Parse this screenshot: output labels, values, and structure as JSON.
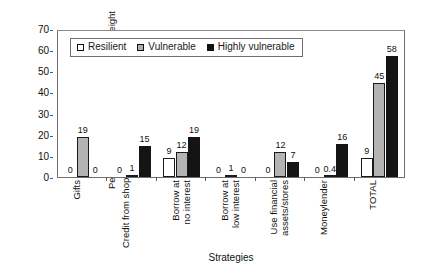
{
  "chart_data": {
    "type": "bar",
    "title": "",
    "xlabel": "Strategies",
    "ylabel_line1": "Percentage of total illness costs over eight",
    "ylabel_line2": "months covered by strategies",
    "ylim": [
      0,
      70
    ],
    "yticks": [
      0,
      10,
      20,
      30,
      40,
      50,
      60,
      70
    ],
    "grid": false,
    "legend_position": "top-left inside plot",
    "categories": [
      "Gifts",
      "Credit from shop",
      "Borrow at no interest",
      "Borrow at low interest",
      "Use financial assets/stores",
      "Moneylender",
      "TOTAL"
    ],
    "category_lines": [
      [
        "Gifts",
        ""
      ],
      [
        "Credit from shop",
        ""
      ],
      [
        "Borrow at",
        "no interest"
      ],
      [
        "Borrow at",
        "low interest"
      ],
      [
        "Use financial",
        "assets/stores"
      ],
      [
        "Moneylender",
        ""
      ],
      [
        "TOTAL",
        ""
      ]
    ],
    "series": [
      {
        "name": "Resilient",
        "color": "#ffffff",
        "values": [
          0,
          0,
          9,
          0,
          0,
          0,
          9
        ],
        "labels": [
          "0",
          "0",
          "9",
          "0",
          "0",
          "0",
          "9"
        ]
      },
      {
        "name": "Vulnerable",
        "color": "#b3b3b3",
        "values": [
          19,
          1,
          12,
          1,
          12,
          0.4,
          45
        ],
        "labels": [
          "19",
          "1",
          "12",
          "1",
          "12",
          "0.4",
          "45"
        ]
      },
      {
        "name": "Highly vulnerable",
        "color": "#141414",
        "values": [
          0,
          15,
          19,
          0,
          7,
          16,
          58
        ],
        "labels": [
          "0",
          "15",
          "19",
          "0",
          "7",
          "16",
          "58"
        ]
      }
    ]
  },
  "legend": {
    "items": [
      {
        "label": "Resilient"
      },
      {
        "label": "Vulnerable"
      },
      {
        "label": "Highly vulnerable"
      }
    ]
  }
}
